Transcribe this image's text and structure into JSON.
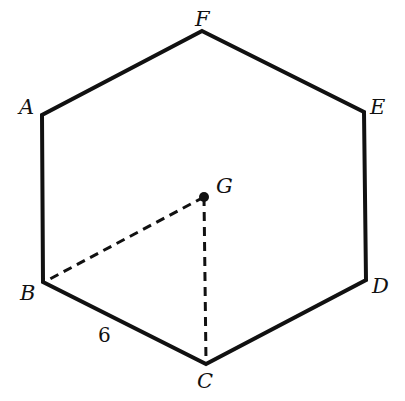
{
  "diagram": {
    "shape": "hexagon",
    "vertices": [
      {
        "name": "F",
        "x": 202,
        "y": 31
      },
      {
        "name": "E",
        "x": 364,
        "y": 112
      },
      {
        "name": "D",
        "x": 366,
        "y": 280
      },
      {
        "name": "C",
        "x": 206,
        "y": 364
      },
      {
        "name": "B",
        "x": 43,
        "y": 282
      },
      {
        "name": "A",
        "x": 42,
        "y": 115
      }
    ],
    "center": {
      "name": "G",
      "x": 204,
      "y": 197
    },
    "dashed_segments": [
      {
        "from": "G",
        "to": "B"
      },
      {
        "from": "G",
        "to": "C"
      }
    ],
    "labels": {
      "F": "F",
      "E": "E",
      "D": "D",
      "C": "C",
      "B": "B",
      "A": "A",
      "G": "G"
    },
    "side_label": {
      "segment": "BC",
      "value": "6"
    },
    "colors": {
      "stroke": "#111111",
      "background": "#ffffff"
    }
  }
}
